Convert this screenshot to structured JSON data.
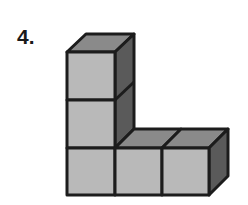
{
  "problem": {
    "number_label": "4."
  },
  "figure": {
    "cube_count": 5,
    "layout": {
      "columns": [
        {
          "column": 1,
          "height": 3
        },
        {
          "column": 2,
          "height": 1
        },
        {
          "column": 3,
          "height": 1
        }
      ]
    },
    "colors": {
      "front_face": "#b9b9b9",
      "top_face": "#8a8a8a",
      "side_face": "#5a5a5a",
      "edge": "#1c1c1c",
      "background": "#ffffff"
    }
  }
}
